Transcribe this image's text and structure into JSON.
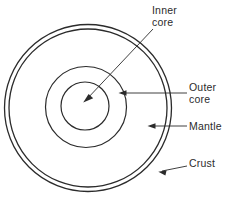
{
  "diagram": {
    "background_color": "#ffffff",
    "stroke_color": "#2b2b2b",
    "labels": {
      "inner_core": "Inner\ncore",
      "outer_core": "Outer\ncore",
      "mantle": "Mantle",
      "crust": "Crust"
    },
    "layers": [
      {
        "name": "crust",
        "label": "Crust",
        "shape": "circle",
        "center_x": 88,
        "center_y": 108,
        "radius": 83,
        "stroke_width": 1.2,
        "note": "outermost thin shell, drawn as a pair of concentric circles"
      },
      {
        "name": "crust-inner-boundary",
        "label": "Crust",
        "shape": "circle",
        "center_x": 88,
        "center_y": 108,
        "radius": 79,
        "stroke_width": 1.2,
        "note": "inner edge of the crust band"
      },
      {
        "name": "mantle",
        "label": "Mantle",
        "shape": "circle",
        "center_x": 86,
        "center_y": 107,
        "radius": 40.5,
        "stroke_width": 1.1,
        "note": "region between the outer core circle and the crust"
      },
      {
        "name": "outer-core",
        "label": "Outer core",
        "shape": "circle",
        "center_x": 85,
        "center_y": 106,
        "radius": 24,
        "stroke_width": 1.1,
        "note": "region between the inner core circle and the mantle boundary"
      },
      {
        "name": "inner-core",
        "label": "Inner core",
        "shape": "circle",
        "center_x": 85,
        "center_y": 106,
        "radius": 0,
        "stroke_width": 0,
        "note": "innermost region bounded by the smallest circle"
      }
    ],
    "leaders": [
      {
        "name": "inner-core-leader",
        "from_x": 152,
        "from_y": 30,
        "to_x": 84,
        "to_y": 99,
        "arrow": "at-target",
        "direction": "down-left"
      },
      {
        "name": "outer-core-leader",
        "from_x": 187,
        "from_y": 93,
        "to_x": 120,
        "to_y": 93,
        "arrow": "at-target",
        "direction": "left"
      },
      {
        "name": "mantle-leader",
        "from_x": 187,
        "from_y": 126,
        "to_x": 148,
        "to_y": 126,
        "arrow": "at-target",
        "direction": "left"
      },
      {
        "name": "crust-leader",
        "from_x": 187,
        "from_y": 165,
        "to_x": 158,
        "to_y": 172,
        "arrow": "at-target",
        "direction": "left-up"
      }
    ]
  }
}
